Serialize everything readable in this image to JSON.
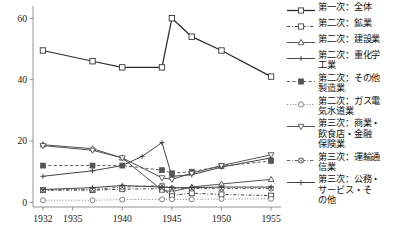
{
  "chart_data": {
    "type": "line",
    "title": "",
    "xlabel": "",
    "ylabel": "",
    "x": [
      1932,
      1935,
      1937,
      1940,
      1942,
      1944,
      1945,
      1947,
      1950,
      1955
    ],
    "xticks": [
      "1932",
      "1935",
      "1940",
      "1945",
      "1950",
      "1955"
    ],
    "xtick_values": [
      1932,
      1935,
      1940,
      1945,
      1950,
      1955
    ],
    "xlim": [
      1931,
      1956
    ],
    "yticks": [
      "0",
      "20",
      "40",
      "60"
    ],
    "ytick_values": [
      0,
      20,
      40,
      60
    ],
    "ylim": [
      -1.5,
      64
    ],
    "grid": false,
    "legend_position": "right",
    "series": [
      {
        "name": "第一次：全体",
        "marker": "square-open",
        "dash": "solid",
        "color": "#2b2b2b",
        "x": [
          1932,
          1937,
          1940,
          1944,
          1945,
          1947,
          1950,
          1955
        ],
        "values": [
          49.5,
          46.0,
          44.0,
          44.0,
          60.0,
          54.0,
          49.5,
          41.0
        ]
      },
      {
        "name": "第二次：鉱業",
        "marker": "square-open",
        "dash": "dashdot",
        "color": "#3a3a3a",
        "x": [
          1932,
          1937,
          1940,
          1944,
          1945,
          1947,
          1950,
          1955
        ],
        "values": [
          4.0,
          4.0,
          4.3,
          4.5,
          2.3,
          3.0,
          2.6,
          2.2
        ]
      },
      {
        "name": "第二次：建設業",
        "marker": "triangle-open",
        "dash": "solid",
        "color": "#4a4a4a",
        "x": [
          1932,
          1937,
          1940,
          1944,
          1945,
          1947,
          1950,
          1955
        ],
        "values": [
          18.8,
          17.5,
          14.5,
          4.0,
          3.5,
          5.0,
          6.0,
          7.5
        ]
      },
      {
        "name": "第二次：重化学\n工業",
        "marker": "plus",
        "dash": "solid",
        "color": "#3a3a3a",
        "x": [
          1932,
          1937,
          1940,
          1942,
          1944,
          1945,
          1947,
          1950,
          1955
        ],
        "values": [
          8.5,
          10.3,
          12.0,
          15.0,
          19.5,
          8.5,
          9.0,
          11.5,
          14.5
        ]
      },
      {
        "name": "第二次：その他\n製造業",
        "marker": "square-filled",
        "dash": "dashed",
        "color": "#555555",
        "x": [
          1932,
          1937,
          1940,
          1944,
          1945,
          1947,
          1950,
          1955
        ],
        "values": [
          12.0,
          12.0,
          12.0,
          10.5,
          9.5,
          10.0,
          11.8,
          13.5
        ]
      },
      {
        "name": "第二次：ガス電\n気水道業",
        "marker": "circle-open",
        "dash": "dotted",
        "color": "#6a6a6a",
        "x": [
          1932,
          1937,
          1940,
          1944,
          1945,
          1947,
          1950,
          1955
        ],
        "values": [
          0.7,
          0.7,
          0.9,
          1.0,
          1.0,
          1.0,
          1.1,
          1.2
        ]
      },
      {
        "name": "第三次：商業・\n飲食店・金融\n保険業",
        "marker": "triangle-down-open",
        "dash": "solid",
        "color": "#4a4a4a",
        "x": [
          1932,
          1937,
          1940,
          1944,
          1945,
          1947,
          1950,
          1955
        ],
        "values": [
          18.5,
          17.0,
          14.5,
          8.0,
          7.5,
          9.5,
          12.0,
          15.5
        ]
      },
      {
        "name": "第三次：運輸通\n信業",
        "marker": "circle-crossed",
        "dash": "dashdot",
        "color": "#555555",
        "x": [
          1932,
          1937,
          1940,
          1944,
          1945,
          1947,
          1950,
          1955
        ],
        "values": [
          4.0,
          4.2,
          5.0,
          5.5,
          4.5,
          4.5,
          4.5,
          4.5
        ]
      },
      {
        "name": "第三次：公務・\nサービス・そ\nの他",
        "marker": "plus",
        "dash": "solid",
        "color": "#3a3a3a",
        "x": [
          1932,
          1937,
          1940,
          1944,
          1945,
          1947,
          1950,
          1955
        ],
        "values": [
          4.2,
          4.8,
          5.5,
          5.0,
          4.8,
          4.8,
          5.0,
          5.0
        ]
      }
    ]
  },
  "legend": {
    "items": [
      {
        "label": "第一次：全体"
      },
      {
        "label": "第二次：鉱業"
      },
      {
        "label": "第二次：建設業"
      },
      {
        "label": "第二次：重化学\n工業"
      },
      {
        "label": "第二次：その他\n製造業"
      },
      {
        "label": "第二次：ガス電\n気水道業"
      },
      {
        "label": "第三次：商業・\n飲食店・金融\n保険業"
      },
      {
        "label": "第三次：運輸通\n信業"
      },
      {
        "label": "第三次：公務・\nサービス・そ\nの他"
      }
    ]
  }
}
